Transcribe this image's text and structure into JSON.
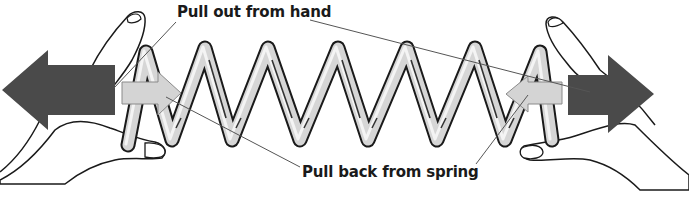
{
  "diagram": {
    "type": "physics-force-illustration",
    "labels": {
      "pull_out": "Pull out from hand",
      "pull_back": "Pull back from spring"
    },
    "caption_fragment": "",
    "elements": {
      "hands": [
        "left-hand",
        "right-hand"
      ],
      "spring": {
        "peaks": 6,
        "style": "coiled-metal-tube"
      },
      "arrows": [
        {
          "id": "left-outward",
          "direction": "left",
          "meaning": "Pull out from hand",
          "shade": "dark"
        },
        {
          "id": "left-inward",
          "direction": "right",
          "meaning": "Pull back from spring",
          "shade": "light"
        },
        {
          "id": "right-inward",
          "direction": "left",
          "meaning": "Pull back from spring",
          "shade": "light"
        },
        {
          "id": "right-outward",
          "direction": "right",
          "meaning": "Pull out from hand",
          "shade": "dark"
        }
      ]
    },
    "colors": {
      "background": "#ffffff",
      "outline": "#1a1a1a",
      "hand_fill": "#ffffff",
      "spring_fill": "#d9d9d9",
      "spring_highlight": "#f2f2f2",
      "dark_arrow": "#4a4a4a",
      "light_arrow": "#d4d4d4",
      "leader_line": "#555555"
    }
  }
}
